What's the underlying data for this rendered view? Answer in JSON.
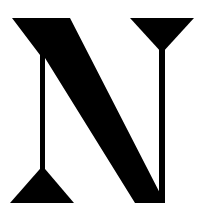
{
  "logo": {
    "letter": "N",
    "description": "Stylized serif letter N logo",
    "fill_color": "#000000",
    "background_color": "#ffffff"
  }
}
